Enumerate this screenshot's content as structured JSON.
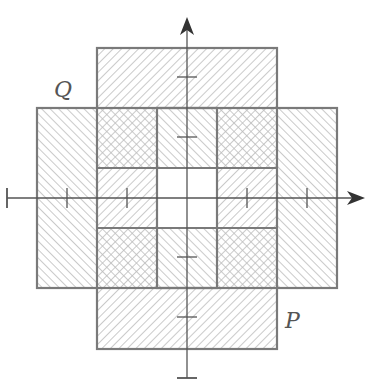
{
  "diagram": {
    "labels": {
      "P": "P",
      "Q": "Q"
    },
    "colors": {
      "stroke": "#7a7a7a",
      "hatch": "#bcbcbc",
      "axis": "#555555",
      "background": "#ffffff"
    },
    "grid": {
      "x_edges": [
        37,
        97,
        157,
        217,
        277,
        337
      ],
      "y_edges": [
        48,
        108,
        168,
        228,
        288,
        349
      ]
    },
    "axes": {
      "origin": [
        187,
        198
      ],
      "x_ticks": [
        67,
        127,
        247,
        307
      ],
      "y_ticks": [
        77,
        137,
        257,
        317
      ],
      "x_start": 7,
      "x_end": 365,
      "y_start": 378,
      "y_end": 18
    },
    "regions": [
      {
        "set": "P",
        "x": 97,
        "y": 48,
        "w": 180,
        "h": 60,
        "hatch": "forward"
      },
      {
        "set": "P",
        "x": 97,
        "y": 288,
        "w": 180,
        "h": 61,
        "hatch": "forward"
      },
      {
        "set": "P",
        "x": 97,
        "y": 168,
        "w": 60,
        "h": 60,
        "hatch": "forward"
      },
      {
        "set": "P",
        "x": 217,
        "y": 168,
        "w": 60,
        "h": 60,
        "hatch": "forward"
      },
      {
        "set": "Q",
        "x": 37,
        "y": 108,
        "w": 60,
        "h": 180,
        "hatch": "backward"
      },
      {
        "set": "Q",
        "x": 277,
        "y": 108,
        "w": 60,
        "h": 180,
        "hatch": "backward"
      },
      {
        "set": "Q",
        "x": 157,
        "y": 108,
        "w": 60,
        "h": 60,
        "hatch": "backward"
      },
      {
        "set": "Q",
        "x": 157,
        "y": 228,
        "w": 60,
        "h": 60,
        "hatch": "backward"
      },
      {
        "set": "P∩Q",
        "x": 97,
        "y": 108,
        "w": 60,
        "h": 60,
        "hatch": "cross"
      },
      {
        "set": "P∩Q",
        "x": 217,
        "y": 108,
        "w": 60,
        "h": 60,
        "hatch": "cross"
      },
      {
        "set": "P∩Q",
        "x": 97,
        "y": 228,
        "w": 60,
        "h": 60,
        "hatch": "cross"
      },
      {
        "set": "P∩Q",
        "x": 217,
        "y": 228,
        "w": 60,
        "h": 60,
        "hatch": "cross"
      },
      {
        "set": "none",
        "x": 157,
        "y": 168,
        "w": 60,
        "h": 60,
        "hatch": "none"
      }
    ]
  }
}
